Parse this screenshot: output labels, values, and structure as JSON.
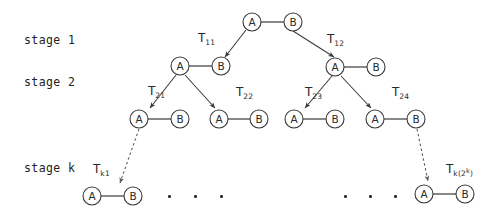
{
  "diagram": {
    "stroke_color": "#3a3a3a",
    "text_color": "#2a2a2a",
    "background": "#ffffff",
    "stages": [
      {
        "id": "stage-1",
        "label": "stage 1",
        "x": 24,
        "y": 33
      },
      {
        "id": "stage-2",
        "label": "stage 2",
        "x": 24,
        "y": 75
      },
      {
        "id": "stage-k",
        "label": "stage k",
        "x": 24,
        "y": 161
      }
    ],
    "node_pairs": [
      {
        "id": "root",
        "a_label": "A",
        "b_label": "B",
        "ax": 252,
        "ay": 22,
        "bx": 293,
        "by": 22
      },
      {
        "id": "s2-l",
        "a_label": "A",
        "b_label": "B",
        "ax": 180,
        "ay": 66,
        "bx": 221,
        "by": 66
      },
      {
        "id": "s2-r",
        "a_label": "A",
        "b_label": "B",
        "ax": 335,
        "ay": 67,
        "bx": 376,
        "by": 67
      },
      {
        "id": "s3-1",
        "a_label": "A",
        "b_label": "B",
        "ax": 139,
        "ay": 119,
        "bx": 180,
        "by": 119
      },
      {
        "id": "s3-2",
        "a_label": "A",
        "b_label": "B",
        "ax": 219,
        "ay": 119,
        "bx": 259,
        "by": 119
      },
      {
        "id": "s3-3",
        "a_label": "A",
        "b_label": "B",
        "ax": 294,
        "ay": 119,
        "bx": 335,
        "by": 119
      },
      {
        "id": "s3-4",
        "a_label": "A",
        "b_label": "B",
        "ax": 375,
        "ay": 119,
        "bx": 416,
        "by": 119
      },
      {
        "id": "sk-l",
        "a_label": "A",
        "b_label": "B",
        "ax": 92,
        "ay": 196,
        "bx": 133,
        "by": 196
      },
      {
        "id": "sk-r",
        "a_label": "A",
        "b_label": "B",
        "ax": 424,
        "ay": 194,
        "bx": 465,
        "by": 194
      }
    ],
    "transitions": [
      {
        "id": "t11",
        "base": "T",
        "sub": "11",
        "sup": "",
        "x": 198,
        "y": 32
      },
      {
        "id": "t12",
        "base": "T",
        "sub": "12",
        "sup": "",
        "x": 327,
        "y": 33
      },
      {
        "id": "t21",
        "base": "T",
        "sub": "21",
        "sup": "",
        "x": 148,
        "y": 85
      },
      {
        "id": "t22",
        "base": "T",
        "sub": "22",
        "sup": "",
        "x": 236,
        "y": 86
      },
      {
        "id": "t23",
        "base": "T",
        "sub": "23",
        "sup": "",
        "x": 305,
        "y": 86
      },
      {
        "id": "t24",
        "base": "T",
        "sub": "24",
        "sup": "",
        "x": 392,
        "y": 86
      },
      {
        "id": "tk1",
        "base": "T",
        "sub": "k1",
        "sup": "",
        "x": 93,
        "y": 163
      },
      {
        "id": "tk2k",
        "base": "T",
        "sub": "k(2",
        "sup": "k",
        "x": 446,
        "y": 163,
        "sub_tail": ")"
      }
    ],
    "ellipsis_groups": [
      {
        "id": "ellipsis-left",
        "y": 196,
        "xs": [
          168,
          194,
          220
        ]
      },
      {
        "id": "ellipsis-right",
        "y": 196,
        "xs": [
          344,
          369,
          394
        ]
      }
    ]
  }
}
